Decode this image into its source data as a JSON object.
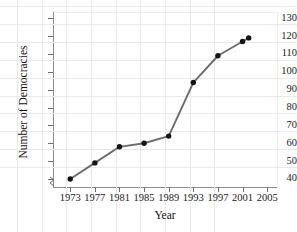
{
  "chart_data": {
    "type": "line",
    "title": "",
    "xlabel": "Year",
    "ylabel": "Number of Democracies",
    "x": [
      1973,
      1977,
      1981,
      1985,
      1989,
      1993,
      1997,
      2001,
      2002
    ],
    "values": [
      40,
      49,
      58,
      60,
      64,
      94,
      109,
      117,
      119
    ],
    "xticks": [
      "1973",
      "1977",
      "1981",
      "1985",
      "1989",
      "1993",
      "1997",
      "2001",
      "2005"
    ],
    "xtick_values": [
      1973,
      1977,
      1981,
      1985,
      1989,
      1993,
      1997,
      2001,
      2005
    ],
    "yticks": [
      "130",
      "120",
      "110",
      "100",
      "90",
      "80",
      "70",
      "60",
      "50",
      "40"
    ],
    "ytick_values": [
      130,
      120,
      110,
      100,
      90,
      80,
      70,
      60,
      50,
      40
    ],
    "xlim": [
      1970.2,
      2006.6
    ],
    "ylim": [
      35.5,
      133.5
    ],
    "grid": true,
    "legend": null,
    "axis_break": "y-axis break below 40",
    "marker": "filled-circle",
    "line_color": "#6b6b70",
    "marker_color": "#141414",
    "grid_color": "#e9e9ec",
    "axis_color": "#8a8a90",
    "text_color": "#1a1a1a",
    "background": "#ffffff"
  }
}
